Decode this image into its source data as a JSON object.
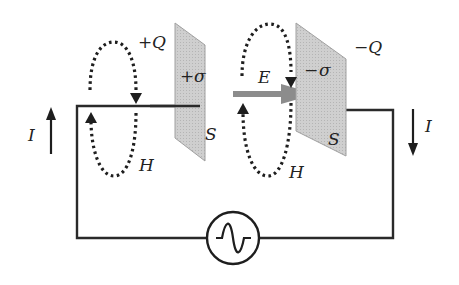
{
  "colors": {
    "wire": "#2a2a2a",
    "plate_fill": "#c8c8c8",
    "plate_stroke": "#9a9a9a",
    "e_arrow": "#8c8c8c",
    "h_loop": "#1e1e1e",
    "background": "#ffffff"
  },
  "labels": {
    "left_charge": "+Q",
    "right_charge": "−Q",
    "left_density_sign": "+",
    "left_density": "σ",
    "right_density_sign": "−",
    "right_density": "σ",
    "left_area": "S",
    "right_area": "S",
    "field_e": "E",
    "field_h_left": "H",
    "field_h_right": "H",
    "current_left": "I",
    "current_right": "I"
  },
  "components": {
    "source": "ac-voltage-source",
    "plates": [
      "positive-plate",
      "negative-plate"
    ],
    "current_left_direction": "up",
    "current_right_direction": "down",
    "e_field_direction": "right"
  }
}
